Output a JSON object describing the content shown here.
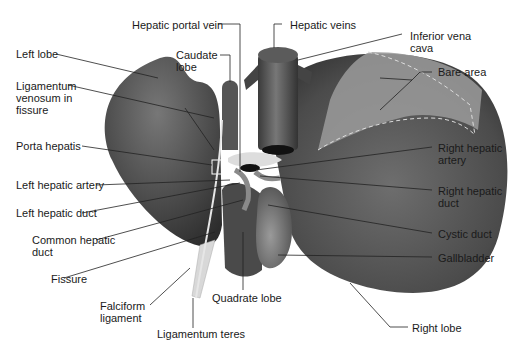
{
  "diagram": {
    "colors": {
      "background": "#ffffff",
      "liver_dark": "#3f3f3f",
      "liver_mid": "#6a6a6a",
      "bare_area": "#9a9a9a",
      "ligament": "#d8d8d8",
      "leader_line": "#222222",
      "text": "#1a1a1a"
    },
    "labels": {
      "hepatic_portal_vein": "Hepatic portal vein",
      "hepatic_veins": "Hepatic veins",
      "inferior_vena_cava": "Inferior vena\ncava",
      "left_lobe": "Left lobe",
      "caudate_lobe": "Caudate\nlobe",
      "bare_area": "Bare area",
      "ligamentum_venosum": "Ligamentum\nvenosum in\nfissure",
      "porta_hepatis": "Porta hepatis",
      "right_hepatic_artery": "Right hepatic\nartery",
      "left_hepatic_artery": "Left hepatic artery",
      "right_hepatic_duct": "Right hepatic\nduct",
      "left_hepatic_duct": "Left hepatic duct",
      "common_hepatic_duct": "Common hepatic\nduct",
      "cystic_duct": "Cystic duct",
      "gallbladder": "Gallbladder",
      "fissure": "Fissure",
      "falciform_ligament": "Falciform\nligament",
      "quadrate_lobe": "Quadrate lobe",
      "ligamentum_teres": "Ligamentum teres",
      "right_lobe": "Right lobe"
    }
  }
}
